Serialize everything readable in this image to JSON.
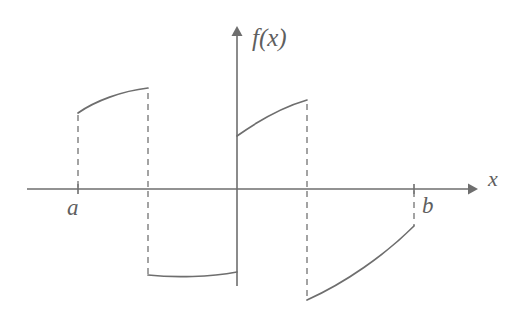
{
  "figure": {
    "title": "",
    "background_color": "#ffffff",
    "line_color": "#6e6e6e",
    "dash_color": "#7d7d7d",
    "label_color": "#5f5f5f",
    "width": 523,
    "height": 317
  },
  "labels": {
    "y_axis": "f(x)",
    "x_axis": "x",
    "left_endpoint": "a",
    "right_endpoint": "b"
  },
  "chart_data": {
    "type": "line",
    "title": "",
    "xlabel": "x",
    "ylabel": "f(x)",
    "grid": false,
    "legend": null,
    "axes": {
      "x_axis_y_pixel": 189,
      "y_axis_x_pixel": 237,
      "x_axis_start_pixel": 27,
      "x_axis_end_pixel": 478,
      "y_axis_top_pixel": 26,
      "y_axis_bottom_pixel": 286,
      "x_axis_arrow": true,
      "y_axis_arrow": true
    },
    "marked_points": [
      {
        "label": "a",
        "x_pixel": 78,
        "axis_tick": true
      },
      {
        "label": "b",
        "x_pixel": 414,
        "axis_tick": true
      }
    ],
    "series": [
      {
        "name": "branch-1",
        "sign": "positive",
        "shape": "concave-down increasing arc",
        "points": [
          {
            "x": 78,
            "y": 113
          },
          {
            "x": 100,
            "y": 99
          },
          {
            "x": 124,
            "y": 92
          },
          {
            "x": 148,
            "y": 88
          }
        ],
        "path": "M 78 113 C 95 101, 122 91, 148 88"
      },
      {
        "name": "branch-2",
        "sign": "negative",
        "shape": "nearly flat slightly concave-up segment",
        "points": [
          {
            "x": 148,
            "y": 275
          },
          {
            "x": 190,
            "y": 276
          },
          {
            "x": 237,
            "y": 272
          }
        ],
        "path": "M 148 275 C 175 278, 210 277, 237 272"
      },
      {
        "name": "branch-3",
        "sign": "positive",
        "shape": "concave-down increasing arc",
        "points": [
          {
            "x": 237,
            "y": 136
          },
          {
            "x": 262,
            "y": 120
          },
          {
            "x": 285,
            "y": 108
          },
          {
            "x": 307,
            "y": 100
          }
        ],
        "path": "M 237 136 C 258 121, 283 107, 307 100"
      },
      {
        "name": "branch-4",
        "sign": "negative",
        "shape": "concave-up increasing curve",
        "points": [
          {
            "x": 307,
            "y": 300
          },
          {
            "x": 345,
            "y": 281
          },
          {
            "x": 382,
            "y": 252
          },
          {
            "x": 414,
            "y": 226
          }
        ],
        "path": "M 307 300 C 345 283, 385 255, 414 226"
      }
    ],
    "discontinuity_guides": [
      {
        "name": "guide-a",
        "x": 78,
        "y_from": 189,
        "y_to": 113
      },
      {
        "name": "guide-jump-1-up",
        "x": 148,
        "y_from": 189,
        "y_to": 88
      },
      {
        "name": "guide-jump-1-dn",
        "x": 148,
        "y_from": 189,
        "y_to": 275
      },
      {
        "name": "guide-jump-2-up",
        "x": 307,
        "y_from": 189,
        "y_to": 100
      },
      {
        "name": "guide-jump-2-dn",
        "x": 307,
        "y_from": 189,
        "y_to": 300
      },
      {
        "name": "guide-b",
        "x": 414,
        "y_from": 189,
        "y_to": 226
      }
    ],
    "axis_ticks": [
      {
        "x": 78,
        "y_top": 184,
        "y_bottom": 194
      },
      {
        "x": 414,
        "y_top": 184,
        "y_bottom": 194
      }
    ]
  }
}
